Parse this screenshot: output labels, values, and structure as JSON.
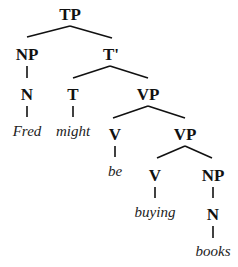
{
  "diagram": {
    "type": "syntax-tree",
    "sentence": "Fred might be buying books",
    "nodes": {
      "tp": "TP",
      "np_subj": "NP",
      "t_bar": "T'",
      "n_subj": "N",
      "t": "T",
      "vp1": "VP",
      "v1": "V",
      "vp2": "VP",
      "v2": "V",
      "np_obj": "NP",
      "n_obj": "N"
    },
    "words": {
      "fred": "Fred",
      "might": "might",
      "be": "be",
      "buying": "buying",
      "books": "books"
    }
  }
}
